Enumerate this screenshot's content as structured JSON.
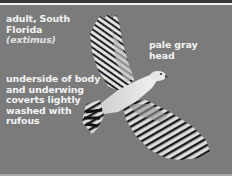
{
  "image": {
    "subject": "hawk in flight, viewed from below",
    "background_color": "#7b7b7b"
  },
  "labels": {
    "subject": {
      "line1": "adult, South",
      "line2": "Florida",
      "line3": "(extimus)"
    },
    "head": {
      "line1": "pale gray",
      "line2": "head"
    },
    "body": {
      "line1": "underside of body",
      "line2": "and underwing",
      "line3": "coverts lightly",
      "line4": "washed with",
      "line5": "rufous"
    }
  }
}
